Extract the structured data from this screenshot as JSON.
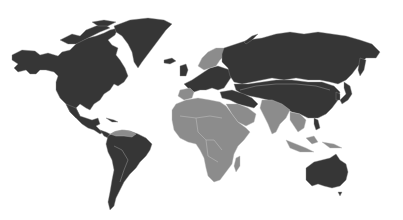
{
  "map": {
    "type": "world-choropleth",
    "background": "#ffffff",
    "legend": [],
    "categories": [
      {
        "name": "dark",
        "color": "#363636",
        "regions": [
          "North America",
          "Greenland",
          "South America",
          "Europe",
          "Russia",
          "Central Asia",
          "China",
          "Mongolia",
          "Japan",
          "Korea",
          "Australia",
          "Turkey",
          "Iran"
        ]
      },
      {
        "name": "light",
        "color": "#8c8c8c",
        "regions": [
          "Africa",
          "Arabian Peninsula",
          "India",
          "Scandinavia",
          "Southeast Asia",
          "Indonesia",
          "Central America",
          "Venezuela/Guianas",
          "Madagascar",
          "Iberia"
        ]
      }
    ]
  }
}
